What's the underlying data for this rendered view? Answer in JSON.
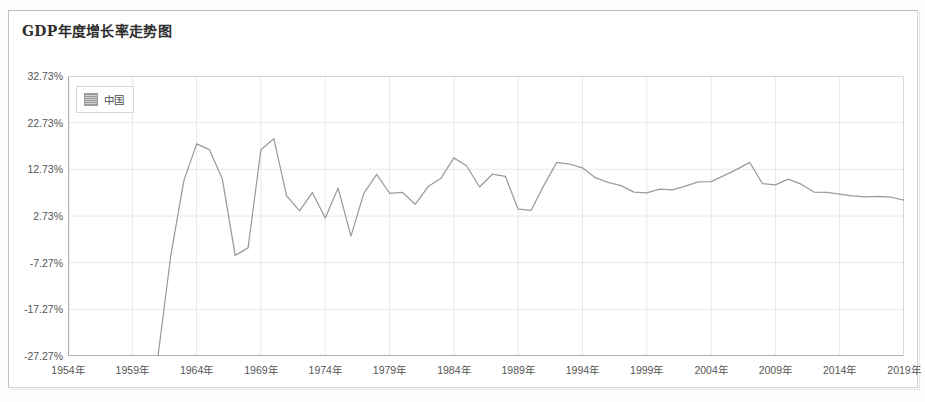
{
  "chart_title": "GDP年度增长率走势图",
  "legend": {
    "position": "top-left-inside",
    "entries": [
      {
        "label": "中国",
        "swatch_color": "#b4b4b4"
      }
    ]
  },
  "axes": {
    "y_tick_labels": [
      "32.73%",
      "22.73%",
      "12.73%",
      "2.73%",
      "-7.27%",
      "-17.27%",
      "-27.27%"
    ],
    "x_tick_labels": [
      "1954年",
      "1959年",
      "1964年",
      "1969年",
      "1974年",
      "1979年",
      "1984年",
      "1989年",
      "1994年",
      "1999年",
      "2004年",
      "2009年",
      "2014年",
      "2019年"
    ]
  },
  "colors": {
    "line": "#9b9b9b",
    "grid": "#e8e8e8",
    "axis": "#b0b0b0",
    "text": "#555555",
    "title": "#2e2e2e",
    "frame": "#bfbfbf",
    "background": "#ffffff"
  },
  "chart_data": {
    "type": "line",
    "title": "GDP年度增长率走势图",
    "xlabel": "",
    "ylabel": "",
    "ylim": [
      -27.27,
      32.73
    ],
    "xlim": [
      1954,
      2019
    ],
    "ytick_values": [
      32.73,
      22.73,
      12.73,
      2.73,
      -7.27,
      -17.27,
      -27.27
    ],
    "ytick_suffix": "%",
    "xtick_values": [
      1954,
      1959,
      1964,
      1969,
      1974,
      1979,
      1984,
      1989,
      1994,
      1999,
      2004,
      2009,
      2014,
      2019
    ],
    "xtick_suffix": "年",
    "grid": true,
    "legend_position": "upper left",
    "series": [
      {
        "name": "中国",
        "color": "#9b9b9b",
        "x": [
          1961,
          1962,
          1963,
          1964,
          1965,
          1966,
          1967,
          1968,
          1969,
          1970,
          1971,
          1972,
          1973,
          1974,
          1975,
          1976,
          1977,
          1978,
          1979,
          1980,
          1981,
          1982,
          1983,
          1984,
          1985,
          1986,
          1987,
          1988,
          1989,
          1990,
          1991,
          1992,
          1993,
          1994,
          1995,
          1996,
          1997,
          1998,
          1999,
          2000,
          2001,
          2002,
          2003,
          2004,
          2005,
          2006,
          2007,
          2008,
          2009,
          2010,
          2011,
          2012,
          2013,
          2014,
          2015,
          2016,
          2017,
          2018,
          2019
        ],
        "values": [
          -27.27,
          -5.58,
          10.2,
          18.18,
          16.95,
          10.65,
          -5.71,
          -4.1,
          16.94,
          19.3,
          7.06,
          3.81,
          7.76,
          2.31,
          8.72,
          -1.57,
          7.57,
          11.67,
          7.6,
          7.81,
          5.24,
          9.05,
          10.84,
          15.19,
          13.44,
          8.94,
          11.69,
          11.23,
          4.18,
          3.91,
          9.29,
          14.22,
          13.87,
          13.05,
          10.95,
          9.93,
          9.23,
          7.85,
          7.67,
          8.49,
          8.34,
          9.13,
          10.04,
          10.11,
          11.39,
          12.72,
          14.23,
          9.65,
          9.4,
          10.64,
          9.55,
          7.86,
          7.77,
          7.43,
          7.04,
          6.85,
          6.95,
          6.75,
          6.11
        ]
      }
    ]
  }
}
